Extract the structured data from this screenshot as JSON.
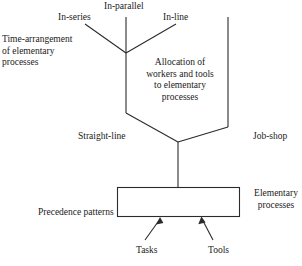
{
  "diagram": {
    "type": "flow-diagram",
    "background_color": "#ffffff",
    "line_color": "#2b2b2b",
    "text_color": "#1a1a1a",
    "labels": {
      "in_series": "In-series",
      "in_parallel": "In-parallel",
      "in_line": "In-line",
      "time_arrangement": "Time-arrangement of elementary processes",
      "allocation": "Allocation of workers and tools to elementary processes",
      "straight_line": "Straight-line",
      "job_shop": "Job-shop",
      "elementary_processes": "Elementary processes",
      "precedence_patterns": "Precedence patterns",
      "tasks": "Tasks",
      "tools": "Tools"
    },
    "shapes": {
      "box_label": "elementary-processes-box",
      "upper_y_junction": "in-series / in-parallel / in-line junction",
      "funnel": "allocation funnel",
      "arrow_left": "tasks-arrow",
      "arrow_right": "tools-arrow"
    }
  }
}
